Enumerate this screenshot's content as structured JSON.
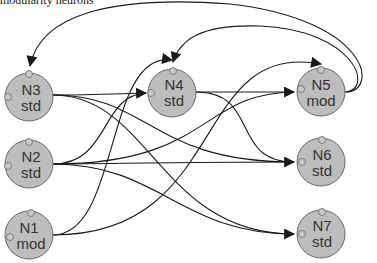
{
  "caption": "modularity neurons",
  "colors": {
    "node_fill": "#bdbdbd",
    "node_stroke": "#6a6a6a",
    "port_fill": "#c8c8c8",
    "edge": "#1a1a1a"
  },
  "nodes": [
    {
      "id": "N3",
      "name": "N3",
      "type": "std",
      "cx": 29,
      "cy": 97
    },
    {
      "id": "N2",
      "name": "N2",
      "type": "std",
      "cx": 29,
      "cy": 164
    },
    {
      "id": "N1",
      "name": "N1",
      "type": "mod",
      "cx": 29,
      "cy": 235
    },
    {
      "id": "N4",
      "name": "N4",
      "type": "std",
      "cx": 172,
      "cy": 93
    },
    {
      "id": "N5",
      "name": "N5",
      "type": "mod",
      "cx": 321,
      "cy": 92
    },
    {
      "id": "N6",
      "name": "N6",
      "type": "std",
      "cx": 321,
      "cy": 162
    },
    {
      "id": "N7",
      "name": "N7",
      "type": "std",
      "cx": 321,
      "cy": 234
    }
  ],
  "edges": [
    {
      "from": "N3",
      "to": "N4"
    },
    {
      "from": "N3",
      "to": "N6"
    },
    {
      "from": "N3",
      "to": "N7"
    },
    {
      "from": "N2",
      "to": "N4"
    },
    {
      "from": "N2",
      "to": "N5"
    },
    {
      "from": "N2",
      "to": "N6"
    },
    {
      "from": "N2",
      "to": "N7"
    },
    {
      "from": "N1",
      "to": "N4"
    },
    {
      "from": "N1",
      "to": "N5"
    },
    {
      "from": "N4",
      "to": "N5"
    },
    {
      "from": "N4",
      "to": "N6"
    },
    {
      "from": "N5",
      "to": "N3"
    },
    {
      "from": "N5",
      "to": "N4"
    }
  ]
}
